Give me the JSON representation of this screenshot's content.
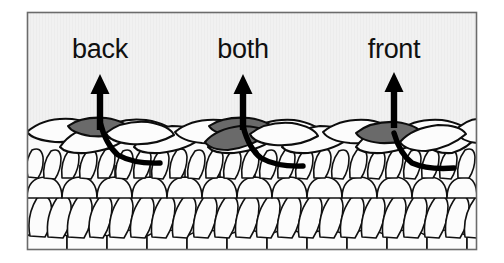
{
  "figure": {
    "kind": "crochet-stitch-placement-diagram",
    "frame": {
      "border_color": "#6b6b6b",
      "background_color": "#f1f1f1",
      "outer_background_color": "#ffffff",
      "x": 27,
      "y": 12,
      "width": 450,
      "height": 238
    },
    "palette": {
      "yarn_fill": "#fbfbfb",
      "yarn_outline": "#0d0d0d",
      "highlight_loop_fill": "#6a6a6a",
      "hook_path_color": "#000000",
      "arrow_color": "#000000",
      "label_color": "#101010"
    },
    "labels": [
      {
        "id": "back",
        "text": "back",
        "x": 100,
        "y": 58
      },
      {
        "id": "both",
        "text": "both",
        "x": 243,
        "y": 58
      },
      {
        "id": "front",
        "text": "front",
        "x": 394,
        "y": 58
      }
    ],
    "arrows": [
      {
        "id": "arrow-back",
        "label": "back",
        "x": 100,
        "tip_y": 74,
        "base_y": 128
      },
      {
        "id": "arrow-both",
        "label": "both",
        "x": 243,
        "tip_y": 74,
        "base_y": 133
      },
      {
        "id": "arrow-front",
        "label": "front",
        "x": 394,
        "tip_y": 72,
        "base_y": 131
      }
    ],
    "highlighted_loops": [
      {
        "id": "highlight-back",
        "label": "back",
        "meaning": "back loop only",
        "loop_count": 1
      },
      {
        "id": "highlight-both",
        "label": "both",
        "meaning": "both loops",
        "loop_count": 2
      },
      {
        "id": "highlight-front",
        "label": "front",
        "meaning": "front loop only",
        "loop_count": 1
      }
    ],
    "hook_paths": [
      {
        "id": "hook-path-back",
        "label": "back"
      },
      {
        "id": "hook-path-both",
        "label": "both"
      },
      {
        "id": "hook-path-front",
        "label": "front"
      }
    ],
    "fabric": {
      "rows": [
        {
          "id": "row-top",
          "role": "working-row-with-visible-loops"
        },
        {
          "id": "row-second",
          "role": "stitch-texture-row"
        },
        {
          "id": "row-third",
          "role": "stitch-texture-row"
        },
        {
          "id": "row-fourth",
          "role": "diagonal-stitch-row"
        },
        {
          "id": "row-bottom",
          "role": "foundation-row"
        }
      ]
    }
  }
}
